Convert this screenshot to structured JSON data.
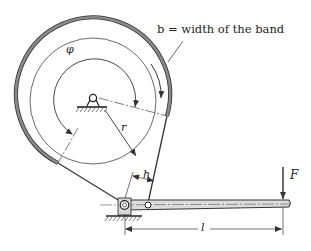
{
  "figure": {
    "type": "band brake mechanism",
    "labels": {
      "band_width": "b = width of the band",
      "wrap_angle": "φ",
      "drum_radius": "r",
      "band_offset": "h",
      "force": "F",
      "lever_length": "l"
    },
    "colors": {
      "band": "#888888",
      "lines": "#333333",
      "lever_fill": "#dddddd",
      "background": "#ffffff"
    }
  }
}
